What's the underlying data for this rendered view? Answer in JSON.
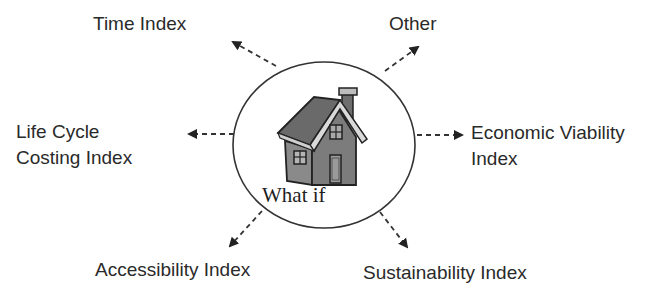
{
  "diagram": {
    "center": {
      "label": "What if",
      "icon": "house-icon"
    },
    "nodes": [
      {
        "id": "time",
        "label": "Time Index",
        "direction": "up-left"
      },
      {
        "id": "other",
        "label": "Other",
        "direction": "up-right"
      },
      {
        "id": "lcc",
        "label_line1": "Life Cycle",
        "label_line2": "Costing Index",
        "direction": "left"
      },
      {
        "id": "econ",
        "label_line1": "Economic Viability",
        "label_line2": "Index",
        "direction": "right"
      },
      {
        "id": "access",
        "label": "Accessibility Index",
        "direction": "down-left"
      },
      {
        "id": "sustain",
        "label": "Sustainability Index",
        "direction": "down-right"
      }
    ],
    "colors": {
      "text": "#2a2a2a",
      "stroke": "#333333",
      "house_roof": "#7a7a7a",
      "house_wall": "#8c8c8c",
      "background": "#ffffff"
    }
  }
}
